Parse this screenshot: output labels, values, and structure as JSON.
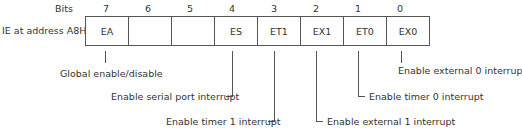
{
  "header": {
    "bits_label": "Bits",
    "register_label": "IE at address A8H"
  },
  "bits": [
    "7",
    "6",
    "5",
    "4",
    "3",
    "2",
    "1",
    "0"
  ],
  "cells": [
    "EA",
    "",
    "",
    "ES",
    "ET1",
    "EX1",
    "ET0",
    "EX0"
  ],
  "descriptions": {
    "ea": "Global enable/disable",
    "es": "Enable serial port interrupt",
    "et1": "Enable timer 1 interrupt",
    "ex1": "Enable external 1 interrupt",
    "et0": "Enable timer 0 interrupt",
    "ex0": "Enable external 0 interrup"
  }
}
